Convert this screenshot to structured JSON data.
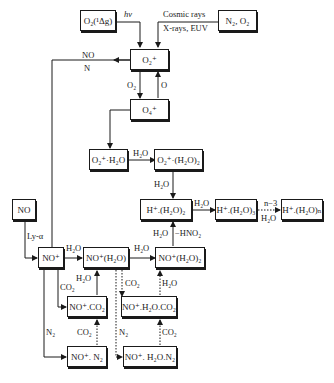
{
  "diagram": {
    "type": "reaction-scheme",
    "nodes": [
      {
        "id": "o2_delta",
        "label": "O₂(¹Δg)"
      },
      {
        "id": "n2_o2",
        "label": "N₂, O₂"
      },
      {
        "id": "o2p",
        "label": "O₂⁺"
      },
      {
        "id": "o4p",
        "label": "O₄⁺"
      },
      {
        "id": "o2p_h2o",
        "label": "O₂⁺·H₂O"
      },
      {
        "id": "o2p_h2o2",
        "label": "O₂⁺·(H₂O)₂"
      },
      {
        "id": "hp_h2o2",
        "label": "H⁺.(H₂O)₂"
      },
      {
        "id": "hp_h2o3",
        "label": "H⁺.(H₂O)₃"
      },
      {
        "id": "hp_h2on",
        "label": "H⁺.(H₂O)ₙ"
      },
      {
        "id": "no",
        "label": "NO"
      },
      {
        "id": "nop",
        "label": "NO⁺"
      },
      {
        "id": "nop_h2o",
        "label": "NO⁺(H₂O)"
      },
      {
        "id": "nop_h2o2",
        "label": "NO⁺(H₂O)₂"
      },
      {
        "id": "nop_co2",
        "label": "NO⁺.CO₂"
      },
      {
        "id": "nop_h2o_co2",
        "label": "NO⁺.H₂O.CO₂"
      },
      {
        "id": "nop_n2",
        "label": "NO⁺. N₂"
      },
      {
        "id": "nop_h2o_n2",
        "label": "NO⁺. H₂O.N₂"
      }
    ],
    "edge_labels": {
      "hv": "hν",
      "cosmic1": "Cosmic rays",
      "cosmic2": "X-rays, EUV",
      "no": "NO",
      "n": "N",
      "o2": "O₂",
      "o": "O",
      "h2o_a": "H₂O",
      "h2o_b": "H₂O",
      "h2o_c": "H₂O",
      "n3": "n−3",
      "h2o_d": "H₂O",
      "h2o_e": "H₂O",
      "hno2": "−HNO₂",
      "lya": "Ly-α",
      "h2o_f": "H₂O",
      "h2o_g": "H₂O",
      "h2o_h": "H₂O",
      "co2_a": "CO₂",
      "co2_b": "CO₂",
      "h2o_i": "H₂O",
      "n2_a": "N₂",
      "co2_c": "CO₂",
      "n2_b": "N₂",
      "co2_d": "CO₂"
    }
  }
}
